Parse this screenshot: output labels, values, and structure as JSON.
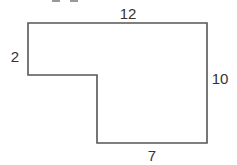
{
  "diagram": {
    "type": "rectilinear-polygon",
    "stroke_color": "#555555",
    "labels": {
      "top": "12",
      "left": "2",
      "right": "10",
      "bottom": "7"
    }
  }
}
